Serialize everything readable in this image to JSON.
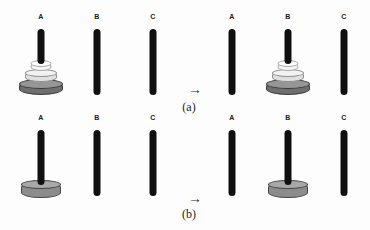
{
  "figure": {
    "peg_labels": [
      "A",
      "B",
      "C"
    ],
    "rows": [
      {
        "caption": "(a)",
        "arrow": "→",
        "states": [
          {
            "name": "before",
            "pegs": [
              {
                "label": "A",
                "disks": [
                  "large",
                  "medium",
                  "small"
                ]
              },
              {
                "label": "B",
                "disks": []
              },
              {
                "label": "C",
                "disks": []
              }
            ]
          },
          {
            "name": "after",
            "pegs": [
              {
                "label": "A",
                "disks": []
              },
              {
                "label": "B",
                "disks": [
                  "large",
                  "medium",
                  "small"
                ]
              },
              {
                "label": "C",
                "disks": []
              }
            ]
          }
        ]
      },
      {
        "caption": "(b)",
        "arrow": "→",
        "states": [
          {
            "name": "before",
            "pegs": [
              {
                "label": "A",
                "disks": [
                  "single"
                ]
              },
              {
                "label": "B",
                "disks": []
              },
              {
                "label": "C",
                "disks": []
              }
            ]
          },
          {
            "name": "after",
            "pegs": [
              {
                "label": "A",
                "disks": []
              },
              {
                "label": "B",
                "disks": [
                  "single"
                ]
              },
              {
                "label": "C",
                "disks": []
              }
            ]
          }
        ]
      }
    ],
    "disk_specs": {
      "large": {
        "w": 44,
        "ell": 10,
        "total": 16,
        "rise": 13,
        "drop": 0,
        "side": "#6e6e6e",
        "top": "#969696",
        "border": "#3a3a3a"
      },
      "medium": {
        "w": 32,
        "ell": 8,
        "total": 13,
        "rise": 11,
        "drop": 0,
        "side": "#e0e0e0",
        "top": "#f2f2f2",
        "border": "#8f8f8f"
      },
      "small": {
        "w": 21,
        "ell": 7,
        "total": 11,
        "rise": 9,
        "drop": 0,
        "side": "#f5f5f5",
        "top": "#ffffff",
        "border": "#aaaaaa"
      },
      "single": {
        "w": 40,
        "ell": 9,
        "total": 18,
        "rise": 14,
        "drop": 2,
        "side": "#8c8c8c",
        "top": "#a8a8a8",
        "border": "#474747"
      }
    },
    "colors": {
      "peg": "#101010",
      "label_text": "#1a1a1a",
      "caption_text": "#1f1f1f",
      "background": "#fdfdfd"
    }
  },
  "edge_fragments": [
    {
      "y": -3,
      "ch": "r"
    },
    {
      "y": 16,
      "ch": "l"
    },
    {
      "y": 34,
      "ch": "e"
    },
    {
      "y": 53,
      "ch": ":"
    },
    {
      "y": 70,
      "ch": "e"
    },
    {
      "y": 90,
      "ch": "a"
    },
    {
      "y": 106,
      "ch": "i"
    },
    {
      "y": 128,
      "ch": "e"
    },
    {
      "y": 146,
      "ch": "s"
    },
    {
      "y": 166,
      "ch": "t"
    },
    {
      "y": 186,
      "ch": "i"
    },
    {
      "y": 202,
      "ch": "e"
    },
    {
      "y": 218,
      "ch": "t"
    }
  ]
}
